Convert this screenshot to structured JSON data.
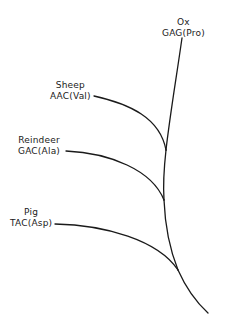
{
  "diagram": {
    "type": "phylogenetic-tree",
    "line_color": "#1a1a1a",
    "taxa": [
      {
        "id": "ox",
        "species": "Ox",
        "codon": "GAG(Pro)"
      },
      {
        "id": "sheep",
        "species": "Sheep",
        "codon": "AAC(Val)"
      },
      {
        "id": "reindeer",
        "species": "Reindeer",
        "codon": "GAC(Ala)"
      },
      {
        "id": "pig",
        "species": "Pig",
        "codon": "TAC(Asp)"
      }
    ]
  }
}
